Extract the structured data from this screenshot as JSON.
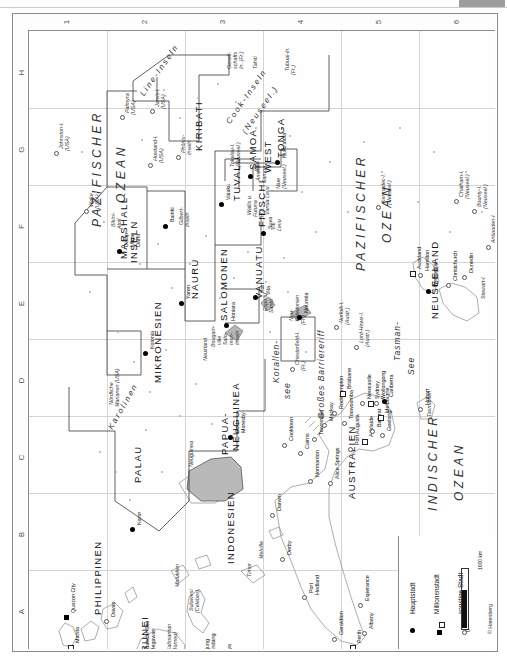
{
  "page": {
    "orientation": "rotated-90-ccw",
    "copyright": "© Harenberg"
  },
  "index": {
    "numbers": [
      "1",
      "2",
      "3",
      "4",
      "5",
      "6"
    ],
    "letters": [
      "H",
      "G",
      "F",
      "E",
      "D",
      "C",
      "B",
      "A"
    ]
  },
  "oceans": [
    {
      "name": "PAZIFISCHER",
      "x": 62,
      "y": 196
    },
    {
      "name": "OZEAN",
      "x": 86,
      "y": 172
    },
    {
      "name": "PAZIFISCHER",
      "x": 326,
      "y": 240
    },
    {
      "name": "OZEAN",
      "x": 352,
      "y": 212
    },
    {
      "name": "INDISCHER",
      "x": 398,
      "y": 480
    },
    {
      "name": "OZEAN",
      "x": 424,
      "y": 470
    }
  ],
  "seas": [
    {
      "name": "Korallen-",
      "x": 243,
      "y": 352
    },
    {
      "name": "see",
      "x": 254,
      "y": 368
    },
    {
      "name": "Tasman-",
      "x": 364,
      "y": 330
    },
    {
      "name": "See",
      "x": 378,
      "y": 344
    },
    {
      "name": "Großes Barriereriff",
      "x": 288,
      "y": 388
    }
  ],
  "countries": [
    {
      "name": "KIRIBATI",
      "x": 165,
      "y": 120
    },
    {
      "name": "MARSHALL-",
      "x": 90,
      "y": 228
    },
    {
      "name": "INSELN",
      "x": 100,
      "y": 232
    },
    {
      "name": "MIKRONESIEN",
      "x": 124,
      "y": 352
    },
    {
      "name": "NAURU",
      "x": 161,
      "y": 268
    },
    {
      "name": "SALOMONEN",
      "x": 190,
      "y": 290
    },
    {
      "name": "TUVALU",
      "x": 203,
      "y": 170
    },
    {
      "name": "VANUATU",
      "x": 225,
      "y": 268
    },
    {
      "name": "FIDSCHI",
      "x": 228,
      "y": 196
    },
    {
      "name": "SAMOA",
      "x": 219,
      "y": 139
    },
    {
      "name": "WEST",
      "x": 234,
      "y": 142
    },
    {
      "name": "TONGA",
      "x": 247,
      "y": 127
    },
    {
      "name": "PALAU",
      "x": 104,
      "y": 452
    },
    {
      "name": "PAPUA-",
      "x": 191,
      "y": 424
    },
    {
      "name": "NEUGUINEA",
      "x": 202,
      "y": 420
    },
    {
      "name": "INDONESIEN",
      "x": 197,
      "y": 533
    },
    {
      "name": "PHILIPPINEN",
      "x": 64,
      "y": 584
    },
    {
      "name": "BRUNEI",
      "x": 111,
      "y": 629
    },
    {
      "name": "AUSTRALIEN",
      "x": 318,
      "y": 468
    },
    {
      "name": "NEUSEELAND",
      "x": 401,
      "y": 288
    }
  ],
  "archipelagos": [
    {
      "name": "Line-Inseln",
      "x": 110,
      "y": 62,
      "rot": -55
    },
    {
      "name": "Cook-Inseln",
      "x": 196,
      "y": 90,
      "rot": -55
    },
    {
      "name": "(Neuseel.)",
      "x": 212,
      "y": 100,
      "rot": -55
    },
    {
      "name": "Karolinen",
      "x": 78,
      "y": 396,
      "rot": -60
    }
  ],
  "islands": [
    {
      "name": "Johnston-I.",
      "x": 30,
      "y": 118,
      "sym": "o"
    },
    {
      "name": "(USA)",
      "x": 36,
      "y": 120
    },
    {
      "name": "Palmyra",
      "x": 96,
      "y": 82,
      "sym": "o"
    },
    {
      "name": "(USA)",
      "x": 102,
      "y": 84
    },
    {
      "name": "Jarvis-I.",
      "x": 126,
      "y": 76,
      "sym": "o"
    },
    {
      "name": "(USA)",
      "x": 132,
      "y": 78
    },
    {
      "name": "Gesell-",
      "x": 198,
      "y": 38
    },
    {
      "name": "schafts",
      "x": 204,
      "y": 38
    },
    {
      "name": "In. (Fr.)",
      "x": 210,
      "y": 38
    },
    {
      "name": "Tahiti",
      "x": 224,
      "y": 38
    },
    {
      "name": "Tubuai-In.",
      "x": 256,
      "y": 40
    },
    {
      "name": "(Fr.)",
      "x": 262,
      "y": 44
    },
    {
      "name": "Wake",
      "x": 60,
      "y": 176,
      "sym": "o"
    },
    {
      "name": "(USA)",
      "x": 66,
      "y": 178
    },
    {
      "name": "Bikini-",
      "x": 82,
      "y": 196
    },
    {
      "name": "Atoll",
      "x": 88,
      "y": 198
    },
    {
      "name": "Howland-I.",
      "x": 124,
      "y": 130,
      "sym": "o"
    },
    {
      "name": "(USA)",
      "x": 130,
      "y": 132
    },
    {
      "name": "Phönix-",
      "x": 152,
      "y": 122,
      "sym": "o"
    },
    {
      "name": "Inseln",
      "x": 158,
      "y": 124
    },
    {
      "name": "Gilbert-",
      "x": 150,
      "y": 194
    },
    {
      "name": "Inseln",
      "x": 156,
      "y": 196
    },
    {
      "name": "Tokelau-I.",
      "x": 201,
      "y": 136
    },
    {
      "name": "(Neuseel.)",
      "x": 207,
      "y": 136
    },
    {
      "name": "Amerik.",
      "x": 227,
      "y": 150
    },
    {
      "name": "Samoa",
      "x": 233,
      "y": 152
    },
    {
      "name": "Niue",
      "x": 247,
      "y": 158
    },
    {
      "name": "(Neuseel.)",
      "x": 253,
      "y": 158
    },
    {
      "name": "Wallis u.",
      "x": 218,
      "y": 184
    },
    {
      "name": "Futuna",
      "x": 224,
      "y": 186
    },
    {
      "name": "(Fr.)",
      "x": 230,
      "y": 188
    },
    {
      "name": "Vanua Levu",
      "x": 236,
      "y": 184
    },
    {
      "name": "Viti",
      "x": 242,
      "y": 199
    },
    {
      "name": "Levu",
      "x": 248,
      "y": 200
    },
    {
      "name": "Espiritu",
      "x": 234,
      "y": 280
    },
    {
      "name": "Santo",
      "x": 240,
      "y": 282
    },
    {
      "name": "Neu-",
      "x": 260,
      "y": 290
    },
    {
      "name": "kaledonien",
      "x": 266,
      "y": 290
    },
    {
      "name": "(Fr.)",
      "x": 272,
      "y": 294
    },
    {
      "name": "Chesterfield-I.",
      "x": 266,
      "y": 334,
      "sym": "o"
    },
    {
      "name": "(Fr.)",
      "x": 272,
      "y": 340
    },
    {
      "name": "Norfolk-I.",
      "x": 310,
      "y": 292,
      "sym": "o"
    },
    {
      "name": "(Austr.)",
      "x": 316,
      "y": 294
    },
    {
      "name": "Lord-Howe-I.",
      "x": 330,
      "y": 312,
      "sym": "o"
    },
    {
      "name": "(Austr.)",
      "x": 336,
      "y": 316
    },
    {
      "name": "Kermadec-I.",
      "x": 352,
      "y": 172,
      "sym": "o"
    },
    {
      "name": "(Neuseel.)",
      "x": 358,
      "y": 174
    },
    {
      "name": "Chatham-I.",
      "x": 430,
      "y": 166,
      "sym": "o"
    },
    {
      "name": "(Neuseel.)",
      "x": 436,
      "y": 168
    },
    {
      "name": "Bounty-I.",
      "x": 448,
      "y": 176,
      "sym": "o"
    },
    {
      "name": "(Neuseel.)",
      "x": 454,
      "y": 178
    },
    {
      "name": "Antipoden-I.",
      "x": 462,
      "y": 212,
      "sym": "o"
    },
    {
      "name": "(Neuseel.)",
      "x": 468,
      "y": 214
    },
    {
      "name": "Stewart-I.",
      "x": 452,
      "y": 268
    },
    {
      "name": "Nördliche",
      "x": 80,
      "y": 374
    },
    {
      "name": "Marianen (USA)",
      "x": 86,
      "y": 376
    },
    {
      "name": "Neuirland",
      "x": 174,
      "y": 330
    },
    {
      "name": "Bougain-",
      "x": 182,
      "y": 316
    },
    {
      "name": "ville",
      "x": 188,
      "y": 314
    },
    {
      "name": "Salo-",
      "x": 194,
      "y": 314
    },
    {
      "name": "mon-",
      "x": 200,
      "y": 314
    },
    {
      "name": "Inseln",
      "x": 206,
      "y": 314
    },
    {
      "name": "Neuguinea",
      "x": 160,
      "y": 436
    },
    {
      "name": "Molukken",
      "x": 146,
      "y": 556
    },
    {
      "name": "Sulawesi",
      "x": 160,
      "y": 580
    },
    {
      "name": "(Celebes)",
      "x": 166,
      "y": 582
    },
    {
      "name": "Kalimantan",
      "x": 138,
      "y": 620
    },
    {
      "name": "(Borneo)",
      "x": 144,
      "y": 622
    },
    {
      "name": "Java",
      "x": 196,
      "y": 638
    },
    {
      "name": "Timor",
      "x": 218,
      "y": 546
    },
    {
      "name": "Melville",
      "x": 230,
      "y": 528
    },
    {
      "name": "Tasmanien",
      "x": 398,
      "y": 386
    }
  ],
  "cities": [
    {
      "name": "Manila",
      "x": 46,
      "y": 612,
      "sym": "square-open"
    },
    {
      "name": "Quezon City",
      "x": 42,
      "y": 582,
      "sym": "square-filled"
    },
    {
      "name": "Davao",
      "x": 82,
      "y": 586,
      "sym": "circle-open"
    },
    {
      "name": "Bandar Seri",
      "x": 116,
      "y": 618,
      "sym": "dot"
    },
    {
      "name": "Begawan",
      "x": 122,
      "y": 620
    },
    {
      "name": "Ujung",
      "x": 176,
      "y": 622,
      "sym": "circle-open"
    },
    {
      "name": "Pandang",
      "x": 182,
      "y": 624
    },
    {
      "name": "Surabaya",
      "x": 198,
      "y": 636,
      "sym": "circle-open"
    },
    {
      "name": "Koror",
      "x": 108,
      "y": 494,
      "sym": "dot"
    },
    {
      "name": "Kolonia",
      "x": 121,
      "y": 318,
      "sym": "dot"
    },
    {
      "name": "Dalap-",
      "x": 95,
      "y": 216,
      "sym": "dot"
    },
    {
      "name": "Uliga-",
      "x": 101,
      "y": 216
    },
    {
      "name": "Darrit",
      "x": 107,
      "y": 216
    },
    {
      "name": "Bairiki",
      "x": 141,
      "y": 191,
      "sym": "dot"
    },
    {
      "name": "Yaren",
      "x": 157,
      "y": 268,
      "sym": "dot"
    },
    {
      "name": "Honiara",
      "x": 202,
      "y": 290,
      "sym": "dot"
    },
    {
      "name": "Vaiaku",
      "x": 197,
      "y": 169,
      "sym": "dot"
    },
    {
      "name": "Apia",
      "x": 226,
      "y": 141,
      "sym": "dot"
    },
    {
      "name": "Nuku'alofa",
      "x": 253,
      "y": 127,
      "sym": "dot"
    },
    {
      "name": "Suva",
      "x": 239,
      "y": 198,
      "sym": "dot"
    },
    {
      "name": "Port",
      "x": 231,
      "y": 262,
      "sym": "dot"
    },
    {
      "name": "Vila",
      "x": 237,
      "y": 264
    },
    {
      "name": "Nouméa",
      "x": 275,
      "y": 282,
      "sym": "dot"
    },
    {
      "name": "Port",
      "x": 206,
      "y": 402,
      "sym": "dot"
    },
    {
      "name": "Moresby",
      "x": 212,
      "y": 402
    },
    {
      "name": "Cooktown",
      "x": 260,
      "y": 410,
      "sym": "circle-open"
    },
    {
      "name": "Cairns",
      "x": 276,
      "y": 418,
      "sym": "circle-open"
    },
    {
      "name": "Townsville",
      "x": 290,
      "y": 404,
      "sym": "circle-open"
    },
    {
      "name": "Mackay",
      "x": 300,
      "y": 390,
      "sym": "circle-open"
    },
    {
      "name": "Rockhampton",
      "x": 310,
      "y": 378,
      "sym": "circle-open"
    },
    {
      "name": "Normanton",
      "x": 286,
      "y": 446,
      "sym": "circle-open"
    },
    {
      "name": "Alice Springs",
      "x": 306,
      "y": 448,
      "sym": "circle-open"
    },
    {
      "name": "Darwin",
      "x": 248,
      "y": 480,
      "sym": "circle-open"
    },
    {
      "name": "Derby",
      "x": 258,
      "y": 524,
      "sym": "circle-open"
    },
    {
      "name": "Port",
      "x": 280,
      "y": 562,
      "sym": "circle-open"
    },
    {
      "name": "Hedland",
      "x": 286,
      "y": 564
    },
    {
      "name": "Geraldton",
      "x": 310,
      "y": 604,
      "sym": "circle-open"
    },
    {
      "name": "Perth",
      "x": 328,
      "y": 612,
      "sym": "square-open"
    },
    {
      "name": "Albany",
      "x": 340,
      "y": 598,
      "sym": "circle-open"
    },
    {
      "name": "Esperance",
      "x": 336,
      "y": 570,
      "sym": "circle-open"
    },
    {
      "name": "Port Augusta",
      "x": 326,
      "y": 414,
      "sym": "circle-open"
    },
    {
      "name": "Adelaide",
      "x": 340,
      "y": 406,
      "sym": "square-open"
    },
    {
      "name": "Ballarat",
      "x": 348,
      "y": 396,
      "sym": "circle-open"
    },
    {
      "name": "Geelong",
      "x": 358,
      "y": 400,
      "sym": "circle-open"
    },
    {
      "name": "Melbourne",
      "x": 356,
      "y": 382,
      "sym": "square-open"
    },
    {
      "name": "Toowoomba",
      "x": 320,
      "y": 388,
      "sym": "circle-open"
    },
    {
      "name": "Brisbane",
      "x": 318,
      "y": 358,
      "sym": "square-open"
    },
    {
      "name": "Newcastle",
      "x": 338,
      "y": 368,
      "sym": "circle-open"
    },
    {
      "name": "Sydney",
      "x": 346,
      "y": 368,
      "sym": "square-open"
    },
    {
      "name": "Wollongong",
      "x": 352,
      "y": 368,
      "sym": "circle-open"
    },
    {
      "name": "Canberra",
      "x": 360,
      "y": 366,
      "sym": "dot"
    },
    {
      "name": "Hobart",
      "x": 396,
      "y": 374,
      "sym": "circle-open"
    },
    {
      "name": "Auckland",
      "x": 388,
      "y": 238,
      "sym": "square-open"
    },
    {
      "name": "Hamilton",
      "x": 396,
      "y": 240,
      "sym": "circle-open"
    },
    {
      "name": "Wellington",
      "x": 404,
      "y": 256,
      "sym": "dot"
    },
    {
      "name": "Christchurch",
      "x": 424,
      "y": 250,
      "sym": "circle-open"
    },
    {
      "name": "Dunedin",
      "x": 440,
      "y": 242,
      "sym": "circle-open"
    }
  ],
  "legend": {
    "items": [
      {
        "label": "Hauptstadt",
        "symbol": "dot"
      },
      {
        "label": "Millionenstadt",
        "symbol": "square-filled"
      },
      {
        "label": "sonstige Stadt",
        "symbol": "circle-open"
      }
    ],
    "scale_label": "1000 km",
    "scale_zero": "0",
    "credit": "© Harenberg"
  }
}
